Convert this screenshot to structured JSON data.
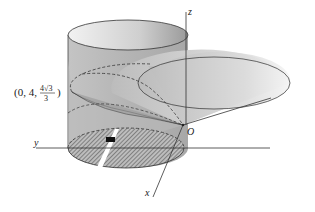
{
  "figure": {
    "type": "3d-geometry-diagram",
    "axes": {
      "z_label": "z",
      "y_label": "y",
      "x_label": "x",
      "origin_label": "O"
    },
    "point_annotation": {
      "prefix": "(0, 4, ",
      "numerator": "4√3",
      "denominator": "3",
      "suffix": ")"
    },
    "colors": {
      "cylinder_fill": "#bdbdbd",
      "cylinder_top": "#d9d9d9",
      "cone_fill": "#d2d2d2",
      "line": "#333333",
      "hatch": "#555555",
      "background": "#ffffff"
    },
    "elements": [
      "cylinder",
      "cone",
      "intersection-curve",
      "hatched-base-disk",
      "strip-element"
    ]
  }
}
